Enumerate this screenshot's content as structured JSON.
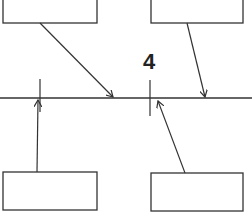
{
  "diagram": {
    "label": "4",
    "colors": {
      "stroke": "#333333",
      "background": "#ffffff"
    },
    "boxes": [
      {
        "id": "top-left",
        "text": ""
      },
      {
        "id": "top-right",
        "text": ""
      },
      {
        "id": "bottom-left",
        "text": ""
      },
      {
        "id": "bottom-right",
        "text": ""
      }
    ]
  }
}
